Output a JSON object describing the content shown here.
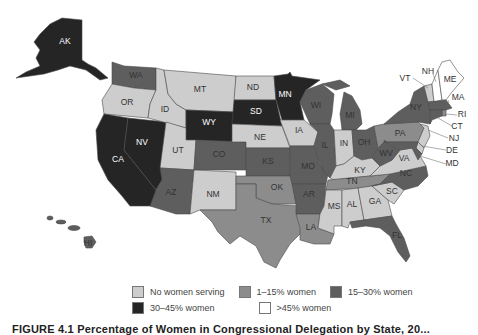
{
  "figure": {
    "caption": "FIGURE 4.1 Percentage of Women in Congressional Delegation by State, 20..."
  },
  "legend": {
    "items": [
      {
        "key": "none",
        "label": "No women serving",
        "color": "#cdcdcd"
      },
      {
        "key": "low",
        "label": "1–15% women",
        "color": "#8c8c8c"
      },
      {
        "key": "mid",
        "label": "15–30% women",
        "color": "#5e5e5e"
      },
      {
        "key": "high",
        "label": "30–45% women",
        "color": "#252525"
      },
      {
        "key": "top",
        "label": ">45% women",
        "color": "#ffffff"
      }
    ]
  },
  "states": [
    {
      "abbr": "AK",
      "category": "high"
    },
    {
      "abbr": "HI",
      "category": "mid"
    },
    {
      "abbr": "WA",
      "category": "mid"
    },
    {
      "abbr": "OR",
      "category": "none"
    },
    {
      "abbr": "CA",
      "category": "high"
    },
    {
      "abbr": "NV",
      "category": "high"
    },
    {
      "abbr": "ID",
      "category": "none"
    },
    {
      "abbr": "MT",
      "category": "none"
    },
    {
      "abbr": "WY",
      "category": "high"
    },
    {
      "abbr": "UT",
      "category": "none"
    },
    {
      "abbr": "CO",
      "category": "mid"
    },
    {
      "abbr": "AZ",
      "category": "mid"
    },
    {
      "abbr": "NM",
      "category": "none"
    },
    {
      "abbr": "ND",
      "category": "none"
    },
    {
      "abbr": "SD",
      "category": "high"
    },
    {
      "abbr": "NE",
      "category": "none"
    },
    {
      "abbr": "KS",
      "category": "mid"
    },
    {
      "abbr": "OK",
      "category": "low"
    },
    {
      "abbr": "TX",
      "category": "low"
    },
    {
      "abbr": "MN",
      "category": "high"
    },
    {
      "abbr": "IA",
      "category": "none"
    },
    {
      "abbr": "MO",
      "category": "mid"
    },
    {
      "abbr": "AR",
      "category": "mid"
    },
    {
      "abbr": "LA",
      "category": "low"
    },
    {
      "abbr": "WI",
      "category": "mid"
    },
    {
      "abbr": "IL",
      "category": "mid"
    },
    {
      "abbr": "MI",
      "category": "mid"
    },
    {
      "abbr": "IN",
      "category": "none"
    },
    {
      "abbr": "OH",
      "category": "mid"
    },
    {
      "abbr": "KY",
      "category": "none"
    },
    {
      "abbr": "TN",
      "category": "low"
    },
    {
      "abbr": "MS",
      "category": "none"
    },
    {
      "abbr": "AL",
      "category": "none"
    },
    {
      "abbr": "GA",
      "category": "none"
    },
    {
      "abbr": "FL",
      "category": "mid"
    },
    {
      "abbr": "SC",
      "category": "none"
    },
    {
      "abbr": "NC",
      "category": "mid"
    },
    {
      "abbr": "VA",
      "category": "none"
    },
    {
      "abbr": "WV",
      "category": "mid"
    },
    {
      "abbr": "PA",
      "category": "low"
    },
    {
      "abbr": "NY",
      "category": "mid"
    },
    {
      "abbr": "VT",
      "category": "none"
    },
    {
      "abbr": "NH",
      "category": "top"
    },
    {
      "abbr": "ME",
      "category": "top"
    },
    {
      "abbr": "MA",
      "category": "mid"
    },
    {
      "abbr": "RI",
      "category": "low"
    },
    {
      "abbr": "CT",
      "category": "mid"
    },
    {
      "abbr": "NJ",
      "category": "none"
    },
    {
      "abbr": "DE",
      "category": "none"
    },
    {
      "abbr": "MD",
      "category": "mid"
    }
  ]
}
